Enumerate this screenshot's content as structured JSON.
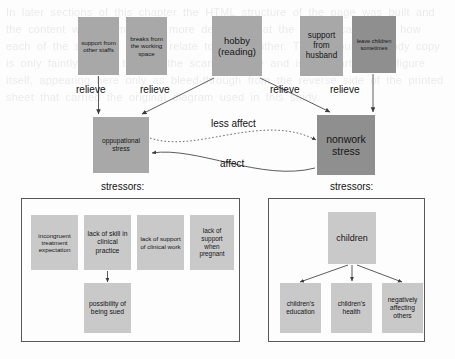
{
  "diagram": {
    "colors": {
      "box_mid": "#a8a8a8",
      "box_dark": "#8f8f8f",
      "box_light": "#c9c9c9",
      "panel_border": "#585858",
      "line": "#4a4a4a",
      "text": "#161616"
    },
    "relievers": [
      {
        "id": "support-other-staffs",
        "label": "support from other staffs",
        "x": 78,
        "y": 17,
        "w": 41,
        "h": 58,
        "shade": "mid",
        "font": 6.2
      },
      {
        "id": "breaks-working-space",
        "label": "breaks from the working space",
        "x": 126,
        "y": 17,
        "w": 41,
        "h": 58,
        "shade": "mid",
        "font": 6.2
      },
      {
        "id": "hobby-reading",
        "label": "hobby (reading)",
        "x": 212,
        "y": 16,
        "w": 50,
        "h": 60,
        "shade": "mid",
        "font": 9.5
      },
      {
        "id": "support-husband",
        "label": "support from husband",
        "x": 300,
        "y": 16,
        "w": 43,
        "h": 60,
        "shade": "mid",
        "font": 8.2
      },
      {
        "id": "leave-children",
        "label": "leave children sometimes",
        "x": 352,
        "y": 16,
        "w": 44,
        "h": 57,
        "shade": "dark",
        "font": 5.6
      }
    ],
    "relieve_labels": [
      {
        "id": "relieve-1",
        "text": "relieve",
        "x": 76,
        "y": 84
      },
      {
        "id": "relieve-2",
        "text": "relieve",
        "x": 140,
        "y": 84
      },
      {
        "id": "relieve-3",
        "text": "relieve",
        "x": 270,
        "y": 84
      },
      {
        "id": "relieve-4",
        "text": "relieve",
        "x": 330,
        "y": 84
      }
    ],
    "stress_nodes": [
      {
        "id": "occupational-stress",
        "label": "oppupational stress",
        "x": 93,
        "y": 117,
        "w": 56,
        "h": 56,
        "shade": "mid",
        "font": 6.6
      },
      {
        "id": "nonwork-stress",
        "label": "nonwork stress",
        "x": 317,
        "y": 115,
        "w": 58,
        "h": 60,
        "shade": "dark",
        "font": 10.5
      }
    ],
    "relation_labels": [
      {
        "id": "less-affect",
        "text": "less affect",
        "x": 211,
        "y": 118
      },
      {
        "id": "affect",
        "text": "affect",
        "x": 220,
        "y": 158
      }
    ],
    "panels": [
      {
        "id": "occupational-stressors-panel",
        "caption": "stressors:",
        "caption_x": 101,
        "caption_y": 181,
        "x": 21,
        "y": 198,
        "w": 219,
        "h": 144,
        "nodes": [
          {
            "id": "incongruent-treatment-expectation",
            "label": "incongruent treatment expectation",
            "x": 31,
            "y": 215,
            "w": 47,
            "h": 55,
            "shade": "light",
            "font": 6.2
          },
          {
            "id": "lack-of-skill-clinical-practice",
            "label": "lack of skill in clinical practice",
            "x": 84,
            "y": 215,
            "w": 47,
            "h": 55,
            "shade": "light",
            "font": 6.8
          },
          {
            "id": "lack-of-support-clinical-work",
            "label": "lack of support of clinical work",
            "x": 137,
            "y": 215,
            "w": 47,
            "h": 55,
            "shade": "light",
            "font": 6.2
          },
          {
            "id": "lack-of-support-when-pregnant",
            "label": "lack of support when pregnant",
            "x": 190,
            "y": 215,
            "w": 44,
            "h": 55,
            "shade": "light",
            "font": 6.4
          },
          {
            "id": "possibility-of-being-sued",
            "label": "possibility of being sued",
            "x": 84,
            "y": 283,
            "w": 47,
            "h": 50,
            "shade": "light",
            "font": 6.8
          }
        ]
      },
      {
        "id": "nonwork-stressors-panel",
        "caption": "stressors:",
        "caption_x": 330,
        "caption_y": 181,
        "x": 268,
        "y": 198,
        "w": 157,
        "h": 144,
        "nodes": [
          {
            "id": "children",
            "label": "children",
            "x": 328,
            "y": 212,
            "w": 48,
            "h": 52,
            "shade": "light",
            "font": 9
          },
          {
            "id": "childrens-education",
            "label": "children's education",
            "x": 280,
            "y": 283,
            "w": 41,
            "h": 50,
            "shade": "light",
            "font": 6.6
          },
          {
            "id": "childrens-health",
            "label": "children's health",
            "x": 331,
            "y": 283,
            "w": 41,
            "h": 50,
            "shade": "light",
            "font": 6.6
          },
          {
            "id": "negatively-affecting-others",
            "label": "negatively affecting others",
            "x": 382,
            "y": 283,
            "w": 41,
            "h": 50,
            "shade": "light",
            "font": 6.6
          }
        ]
      }
    ],
    "background_text": "In later sections of this chapter the HTML structure of the page was built and the content was examined in more detail so that the reader can follow how each of the separate regions relate to one another. The surrounding body copy is only faintly visible through the scanned page and is not part of the figure itself, appearing here only as bleed-through from the reverse side of the printed sheet that carried the original diagram used in this study."
  }
}
